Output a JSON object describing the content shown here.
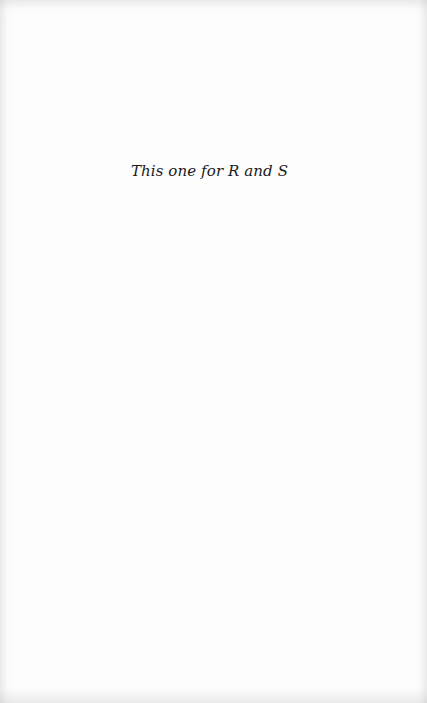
{
  "page": {
    "type": "dedication",
    "dedication_text": "This one for R and S"
  }
}
